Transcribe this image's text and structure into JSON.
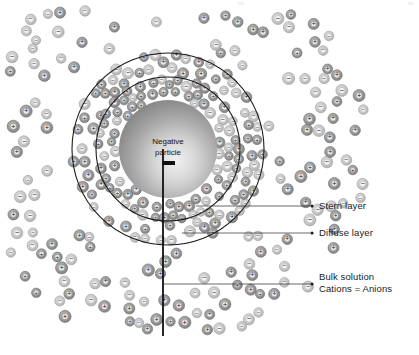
{
  "figure": {
    "width": 419,
    "height": 355,
    "background": "#ffffff",
    "title_text": "",
    "type": "electrical-double-layer-diagram"
  },
  "particle": {
    "caption_line1": "Negative",
    "caption_line2": "particle",
    "charge_symbol": "—",
    "center_x": 168,
    "center_y": 149,
    "radius": 49,
    "fill_light": "#e8e8e8",
    "fill_dark": "#8d8d8d"
  },
  "boundaries": {
    "stern_circle": {
      "center_x": 168,
      "center_y": 149,
      "radius": 72,
      "stroke": "#1a1a1a",
      "stroke_width": 1.1
    },
    "diffuse_circle": {
      "center_x": 168,
      "center_y": 149,
      "radius": 96,
      "stroke": "#1a1a1a",
      "stroke_width": 1.1
    }
  },
  "axis_line": {
    "x": 163,
    "y_start": 149,
    "y_end": 336,
    "stroke": "#101010",
    "stroke_width": 1.8
  },
  "callouts": [
    {
      "id": "stern-layer",
      "label": "Stern layer",
      "leader_x_start": 196,
      "leader_x_end": 310,
      "leader_y": 206,
      "dot_x": 312,
      "dot_y": 206,
      "text_x": 319,
      "text_y": 201
    },
    {
      "id": "diffuse-layer",
      "label": "Diffuse layer",
      "leader_x_start": 182,
      "leader_x_end": 310,
      "leader_y": 233,
      "dot_x": 312,
      "dot_y": 233,
      "text_x": 319,
      "text_y": 228
    },
    {
      "id": "bulk-solution",
      "label": "Bulk solution",
      "label_second_line": "Cations = Anions",
      "leader_x_start": 164,
      "leader_x_end": 310,
      "leader_y": 284,
      "dot_x": 312,
      "dot_y": 284,
      "text_x": 319,
      "text_y": 272,
      "text2_y": 284
    }
  ],
  "ion_legend": {
    "cation_symbol": "+",
    "anion_symbol": "−",
    "cation_fill": "#9a9a9a",
    "anion_fill": "#c9c9c9",
    "ring_stroke": "#6a6a6a"
  },
  "chart_data": {
    "type": "scatter",
    "xlabel": "",
    "ylabel": "",
    "regions": [
      {
        "name": "Negative particle",
        "radius_px": 49,
        "ion_count": 0
      },
      {
        "name": "Stern layer",
        "inner_radius_px": 49,
        "outer_radius_px": 72,
        "ion_count": 74,
        "cation_fraction": 0.72
      },
      {
        "name": "Diffuse layer",
        "inner_radius_px": 72,
        "outer_radius_px": 96,
        "ion_count": 66,
        "cation_fraction": 0.58
      },
      {
        "name": "Bulk solution",
        "inner_radius_px": 96,
        "outer_radius_px": 205,
        "ion_count": 132,
        "cation_fraction": 0.5
      }
    ],
    "series": [
      {
        "name": "Cations",
        "symbol": "+",
        "note": "Excess near particle surface"
      },
      {
        "name": "Anions",
        "symbol": "−",
        "note": "Equal to cations in bulk solution"
      }
    ]
  }
}
